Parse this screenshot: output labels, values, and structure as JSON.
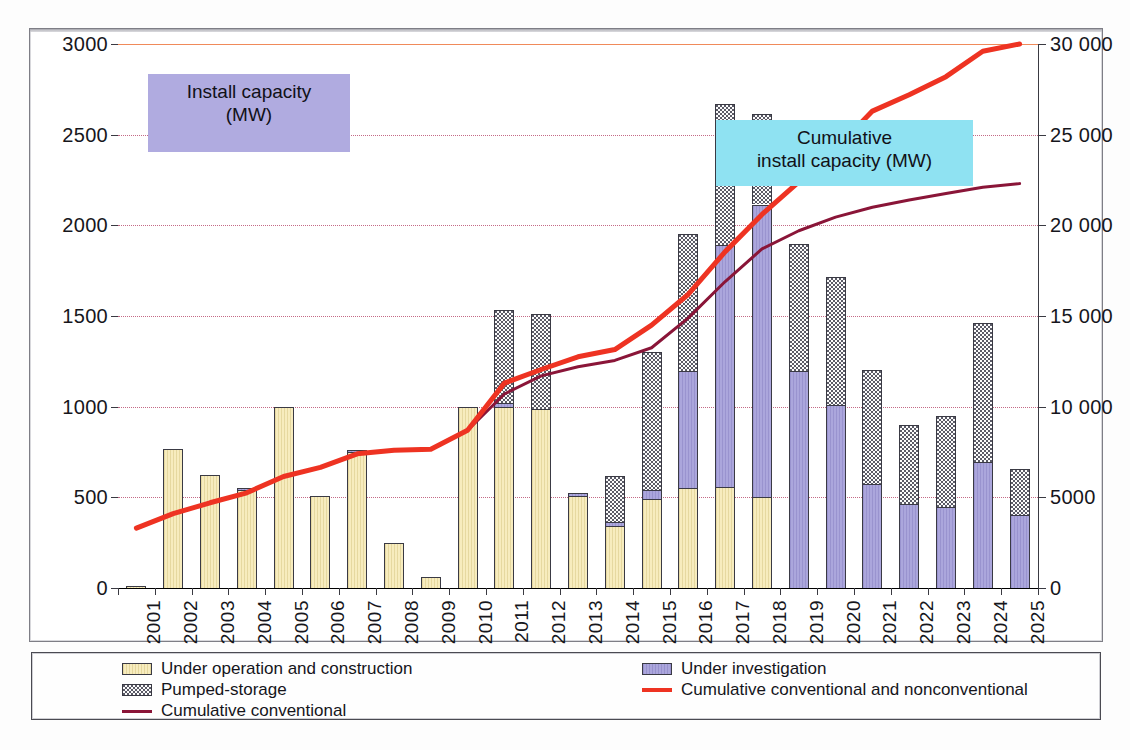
{
  "chart_data": {
    "type": "bar",
    "title": "",
    "xlabel": "",
    "ylabel": "Install capacity (MW)",
    "y2label": "Cumulative install capacity (MW)",
    "grid": true,
    "legend_position": "bottom",
    "categories": [
      "2001",
      "2002",
      "2003",
      "2004",
      "2005",
      "2006",
      "2007",
      "2008",
      "2009",
      "2010",
      "2011",
      "2012",
      "2013",
      "2014",
      "2015",
      "2016",
      "2017",
      "2018",
      "2019",
      "2020",
      "2021",
      "2022",
      "2023",
      "2024",
      "2025"
    ],
    "ylim": [
      0,
      3000
    ],
    "y2lim": [
      0,
      30000
    ],
    "ytick_labels": [
      "0",
      "500",
      "1000",
      "1500",
      "2000",
      "2500",
      "3000"
    ],
    "ytick_values": [
      0,
      500,
      1000,
      1500,
      2000,
      2500,
      3000
    ],
    "y2tick_labels": [
      "0",
      "5000",
      "10 000",
      "15 000",
      "20 000",
      "25 000",
      "30 000"
    ],
    "y2tick_values": [
      0,
      5000,
      10000,
      15000,
      20000,
      25000,
      30000
    ],
    "series": [
      {
        "name": "Under operation and construction",
        "type": "bar-stack",
        "color": "#f7ecbe",
        "axis": "left",
        "values": [
          10,
          765,
          625,
          540,
          1000,
          510,
          750,
          250,
          60,
          1000,
          1000,
          985,
          510,
          340,
          490,
          550,
          555,
          500,
          0,
          0,
          0,
          0,
          0,
          0,
          0
        ]
      },
      {
        "name": "Under investigation",
        "type": "bar-stack",
        "color": "#aba6dc",
        "axis": "left",
        "values": [
          0,
          0,
          0,
          10,
          0,
          0,
          10,
          0,
          0,
          0,
          20,
          0,
          15,
          25,
          50,
          645,
          1335,
          1615,
          1195,
          1010,
          575,
          465,
          445,
          695,
          400
        ]
      },
      {
        "name": "Pumped-storage",
        "type": "bar-stack",
        "color": "#fbfbfb",
        "axis": "left",
        "values": [
          0,
          0,
          0,
          0,
          0,
          0,
          0,
          0,
          0,
          0,
          515,
          525,
          0,
          255,
          760,
          755,
          780,
          500,
          700,
          705,
          630,
          435,
          505,
          765,
          255
        ]
      },
      {
        "name": "Cumulative conventional",
        "type": "line",
        "color": "#8a1538",
        "axis": "right",
        "values": [
          3300,
          4100,
          4700,
          5250,
          6150,
          6650,
          7400,
          7600,
          7650,
          8700,
          10700,
          11700,
          12200,
          12550,
          13250,
          14900,
          16900,
          18700,
          19700,
          20450,
          21000,
          21400,
          21750,
          22100,
          22300
        ]
      },
      {
        "name": "Cumulative conventional and nonconventional",
        "type": "line",
        "color": "#ee3322",
        "axis": "right",
        "values": [
          3300,
          4100,
          4700,
          5250,
          6150,
          6650,
          7400,
          7600,
          7650,
          8700,
          11300,
          12050,
          12750,
          13150,
          14500,
          16200,
          18550,
          20600,
          22400,
          24200,
          26300,
          27200,
          28200,
          29600,
          30000
        ]
      }
    ],
    "annotations": [
      {
        "text_line1": "Install capacity",
        "text_line2": "(MW)",
        "color": "#b0abe0"
      },
      {
        "text_line1": "Cumulative",
        "text_line2": "install capacity (MW)",
        "color": "#8fe2f2"
      }
    ]
  },
  "legend": {
    "left": [
      {
        "label": "Under operation and construction",
        "swatch": "op"
      },
      {
        "label": "Pumped-storage",
        "swatch": "pump"
      },
      {
        "label": "Cumulative conventional",
        "swatch": "line"
      }
    ],
    "right": [
      {
        "label": "Under investigation",
        "swatch": "inv"
      },
      {
        "label": "Cumulative conventional and nonconventional",
        "swatch": "linered"
      }
    ]
  }
}
